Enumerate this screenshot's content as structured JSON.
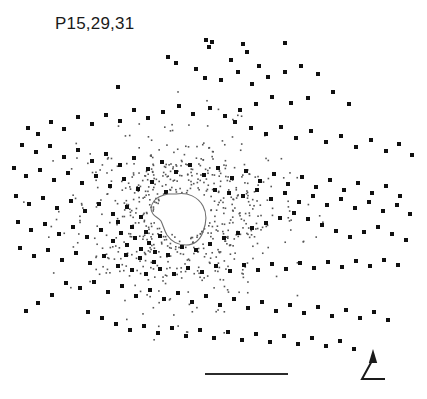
{
  "figure": {
    "title": "P15,29,31",
    "background_color": "#ffffff",
    "width": 427,
    "height": 399
  },
  "chart_data": {
    "type": "scatter",
    "title": "P15,29,31",
    "xlabel": "",
    "ylabel": "",
    "xlim": [
      0,
      427
    ],
    "ylim": [
      399,
      0
    ],
    "grid": false,
    "legend": null,
    "series": [
      {
        "name": "large-marker",
        "marker": "filled-square",
        "size_px": 4,
        "color": "#101010",
        "count": 214,
        "points": [
          [
            206,
            40
          ],
          [
            212,
            42
          ],
          [
            243,
            44
          ],
          [
            285,
            43
          ],
          [
            209,
            47
          ],
          [
            247,
            52
          ],
          [
            118,
            87
          ],
          [
            168,
            57
          ],
          [
            176,
            63
          ],
          [
            231,
            60
          ],
          [
            259,
            66
          ],
          [
            196,
            69
          ],
          [
            238,
            72
          ],
          [
            205,
            78
          ],
          [
            221,
            80
          ],
          [
            252,
            84
          ],
          [
            268,
            77
          ],
          [
            285,
            72
          ],
          [
            301,
            66
          ],
          [
            318,
            74
          ],
          [
            333,
            92
          ],
          [
            349,
            104
          ],
          [
            308,
            98
          ],
          [
            291,
            103
          ],
          [
            272,
            97
          ],
          [
            256,
            104
          ],
          [
            240,
            110
          ],
          [
            225,
            116
          ],
          [
            210,
            108
          ],
          [
            193,
            114
          ],
          [
            179,
            106
          ],
          [
            163,
            112
          ],
          [
            148,
            118
          ],
          [
            134,
            110
          ],
          [
            120,
            121
          ],
          [
            106,
            115
          ],
          [
            92,
            124
          ],
          [
            78,
            117
          ],
          [
            64,
            129
          ],
          [
            51,
            122
          ],
          [
            38,
            134
          ],
          [
            28,
            128
          ],
          [
            235,
            122
          ],
          [
            251,
            128
          ],
          [
            266,
            134
          ],
          [
            281,
            127
          ],
          [
            296,
            138
          ],
          [
            311,
            131
          ],
          [
            326,
            142
          ],
          [
            341,
            136
          ],
          [
            356,
            147
          ],
          [
            371,
            140
          ],
          [
            386,
            151
          ],
          [
            399,
            144
          ],
          [
            412,
            155
          ],
          [
            22,
            145
          ],
          [
            36,
            152
          ],
          [
            50,
            146
          ],
          [
            64,
            157
          ],
          [
            78,
            150
          ],
          [
            92,
            161
          ],
          [
            106,
            154
          ],
          [
            120,
            165
          ],
          [
            134,
            158
          ],
          [
            148,
            169
          ],
          [
            162,
            162
          ],
          [
            176,
            172
          ],
          [
            190,
            165
          ],
          [
            204,
            175
          ],
          [
            218,
            168
          ],
          [
            232,
            178
          ],
          [
            246,
            171
          ],
          [
            260,
            181
          ],
          [
            274,
            174
          ],
          [
            288,
            184
          ],
          [
            302,
            177
          ],
          [
            316,
            187
          ],
          [
            330,
            180
          ],
          [
            344,
            190
          ],
          [
            358,
            183
          ],
          [
            372,
            193
          ],
          [
            386,
            186
          ],
          [
            400,
            196
          ],
          [
            14,
            168
          ],
          [
            26,
            176
          ],
          [
            40,
            170
          ],
          [
            54,
            180
          ],
          [
            68,
            173
          ],
          [
            82,
            183
          ],
          [
            96,
            176
          ],
          [
            110,
            186
          ],
          [
            124,
            179
          ],
          [
            138,
            189
          ],
          [
            152,
            182
          ],
          [
            166,
            192
          ],
          [
            215,
            190
          ],
          [
            229,
            193
          ],
          [
            243,
            196
          ],
          [
            257,
            190
          ],
          [
            271,
            199
          ],
          [
            285,
            193
          ],
          [
            299,
            202
          ],
          [
            313,
            196
          ],
          [
            327,
            205
          ],
          [
            341,
            199
          ],
          [
            355,
            208
          ],
          [
            369,
            202
          ],
          [
            383,
            211
          ],
          [
            397,
            205
          ],
          [
            410,
            214
          ],
          [
            16,
            196
          ],
          [
            29,
            204
          ],
          [
            43,
            198
          ],
          [
            57,
            208
          ],
          [
            71,
            201
          ],
          [
            85,
            211
          ],
          [
            99,
            204
          ],
          [
            113,
            214
          ],
          [
            127,
            207
          ],
          [
            141,
            217
          ],
          [
            118,
            222
          ],
          [
            132,
            227
          ],
          [
            146,
            232
          ],
          [
            160,
            236
          ],
          [
            121,
            233
          ],
          [
            135,
            238
          ],
          [
            149,
            243
          ],
          [
            127,
            245
          ],
          [
            141,
            249
          ],
          [
            155,
            252
          ],
          [
            113,
            241
          ],
          [
            126,
            255
          ],
          [
            140,
            258
          ],
          [
            154,
            262
          ],
          [
            168,
            255
          ],
          [
            182,
            247
          ],
          [
            196,
            250
          ],
          [
            210,
            244
          ],
          [
            224,
            238
          ],
          [
            238,
            233
          ],
          [
            252,
            228
          ],
          [
            266,
            223
          ],
          [
            280,
            218
          ],
          [
            294,
            213
          ],
          [
            308,
            219
          ],
          [
            322,
            225
          ],
          [
            336,
            231
          ],
          [
            350,
            237
          ],
          [
            364,
            232
          ],
          [
            378,
            227
          ],
          [
            392,
            234
          ],
          [
            406,
            240
          ],
          [
            18,
            222
          ],
          [
            31,
            230
          ],
          [
            45,
            224
          ],
          [
            59,
            234
          ],
          [
            73,
            227
          ],
          [
            87,
            237
          ],
          [
            101,
            230
          ],
          [
            20,
            248
          ],
          [
            34,
            256
          ],
          [
            48,
            250
          ],
          [
            62,
            260
          ],
          [
            76,
            253
          ],
          [
            90,
            263
          ],
          [
            104,
            256
          ],
          [
            118,
            266
          ],
          [
            132,
            270
          ],
          [
            146,
            274
          ],
          [
            160,
            269
          ],
          [
            174,
            274
          ],
          [
            188,
            268
          ],
          [
            202,
            272
          ],
          [
            216,
            266
          ],
          [
            230,
            271
          ],
          [
            244,
            265
          ],
          [
            258,
            270
          ],
          [
            272,
            264
          ],
          [
            286,
            269
          ],
          [
            300,
            263
          ],
          [
            314,
            268
          ],
          [
            328,
            262
          ],
          [
            342,
            267
          ],
          [
            356,
            261
          ],
          [
            370,
            266
          ],
          [
            384,
            260
          ],
          [
            398,
            265
          ],
          [
            66,
            283
          ],
          [
            80,
            288
          ],
          [
            94,
            282
          ],
          [
            108,
            292
          ],
          [
            122,
            286
          ],
          [
            136,
            296
          ],
          [
            150,
            290
          ],
          [
            164,
            299
          ],
          [
            178,
            293
          ],
          [
            192,
            302
          ],
          [
            206,
            296
          ],
          [
            220,
            305
          ],
          [
            234,
            299
          ],
          [
            248,
            308
          ],
          [
            262,
            302
          ],
          [
            276,
            311
          ],
          [
            290,
            305
          ],
          [
            304,
            313
          ],
          [
            318,
            307
          ],
          [
            332,
            316
          ],
          [
            346,
            310
          ],
          [
            360,
            318
          ],
          [
            374,
            312
          ],
          [
            388,
            320
          ],
          [
            52,
            295
          ],
          [
            38,
            303
          ],
          [
            26,
            311
          ],
          [
            88,
            312
          ],
          [
            102,
            318
          ],
          [
            116,
            324
          ],
          [
            130,
            330
          ],
          [
            144,
            326
          ],
          [
            158,
            333
          ],
          [
            172,
            328
          ],
          [
            186,
            336
          ],
          [
            200,
            330
          ],
          [
            214,
            338
          ],
          [
            228,
            332
          ],
          [
            242,
            340
          ],
          [
            256,
            334
          ],
          [
            270,
            342
          ],
          [
            284,
            336
          ],
          [
            298,
            344
          ],
          [
            312,
            338
          ],
          [
            326,
            346
          ],
          [
            340,
            341
          ],
          [
            354,
            349
          ]
        ]
      },
      {
        "name": "small-marker",
        "marker": "filled-dot",
        "size_px": 1.6,
        "color": "#555555",
        "count": 640,
        "seed": 20240517,
        "generation": "radial-density",
        "center": [
          183,
          215
        ],
        "spread_x": 118,
        "spread_y": 88,
        "note": "Small dots follow an elliptical density falling off from the central structure, densest between radius 30 and 120 px."
      }
    ],
    "outline": {
      "name": "central-structure-outline",
      "stroke_color": "#6f6f6f",
      "fill": "none",
      "path": "M 176 194 C 188 192 198 197 203 206 C 208 215 206 224 203 232 C 200 240 194 245 186 245 C 178 245 171 241 167 235 C 164 230 163 225 161 221 C 159 218 155 217 153 214 C 150 210 151 205 154 201 C 157 197 163 195 168 194 Z",
      "bbox": [
        151,
        192,
        53,
        54
      ]
    },
    "scale_bar": {
      "name": "scale-bar",
      "x1": 205,
      "y1": 374,
      "x2": 288,
      "y2": 374,
      "color": "#2b2b2b",
      "label": ""
    },
    "orientation_marker": {
      "name": "orientation-arrow",
      "description": "L-shaped axis indicator with arrowhead pointing up",
      "corner": [
        362,
        379
      ],
      "vertical_to": [
        373,
        359
      ],
      "horizontal_to": [
        385,
        379
      ],
      "color": "#1a1a1a"
    }
  }
}
